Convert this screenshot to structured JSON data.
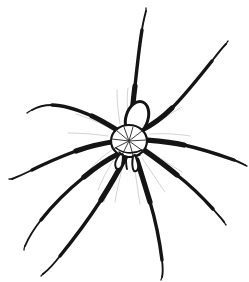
{
  "canvas": {
    "width": 249,
    "height": 282,
    "background_color": "#ffffff",
    "ink_color": "#141414",
    "shading_color": "#9b9b9b",
    "medium": "black-ink-line-drawing",
    "subject": "spider"
  },
  "subject": {
    "name": "spider",
    "common_description": "long-legged spider line drawing",
    "orientation": "dorsal view, head toward lower-left",
    "leg_count": 8,
    "body_parts": [
      "abdomen",
      "cephalothorax",
      "pedipalps",
      "legs"
    ]
  },
  "body": {
    "cephalothorax": {
      "name": "cephalothorax",
      "center_x": 129,
      "center_y": 141,
      "radius_x": 18,
      "radius_y": 16,
      "fill": "#ffffff",
      "stroke": "#141414",
      "has_radial_striations": true,
      "striation_count": 9
    },
    "abdomen": {
      "name": "abdomen",
      "center_x": 137,
      "center_y": 118,
      "radius_x": 11,
      "radius_y": 17,
      "rotation_deg": 18,
      "fill": "#ffffff",
      "stroke": "#141414"
    },
    "pedipalps": {
      "name": "pedipalps",
      "count": 2,
      "left_tip_x": 118,
      "left_tip_y": 166,
      "right_tip_x": 134,
      "right_tip_y": 170
    }
  },
  "legs": [
    {
      "id": "leg-left-1",
      "side": "left",
      "index": 1,
      "description": "front left leg reaching up and left",
      "path": "M 122,133 C 110,126 100,120 86,114 C 70,107 52,104 40,107 C 34,108 30,110 27,112",
      "segments": [
        "femur",
        "tibia",
        "tarsus"
      ],
      "tip_x": 27,
      "tip_y": 112
    },
    {
      "id": "leg-left-2",
      "side": "left",
      "index": 2,
      "description": "second left leg sweeping left and slightly down",
      "path": "M 118,141 C 102,143 86,147 70,153 C 52,160 32,169 18,176 C 14,178 11,179 9,179",
      "segments": [
        "femur",
        "tibia",
        "tarsus"
      ],
      "tip_x": 9,
      "tip_y": 179
    },
    {
      "id": "leg-left-3",
      "side": "left",
      "index": 3,
      "description": "third left leg angling down-left",
      "path": "M 120,153 C 106,160 92,169 78,181 C 62,195 46,212 36,226 C 30,235 26,243 24,249",
      "segments": [
        "femur",
        "tibia",
        "tarsus"
      ],
      "tip_x": 24,
      "tip_y": 249
    },
    {
      "id": "leg-left-4",
      "side": "left",
      "index": 4,
      "description": "rear left leg angling steeply down",
      "path": "M 125,158 C 118,172 108,190 96,210 C 84,230 70,248 56,262 C 50,268 45,272 42,274",
      "segments": [
        "femur",
        "tibia",
        "tarsus"
      ],
      "tip_x": 42,
      "tip_y": 274
    },
    {
      "id": "leg-right-1",
      "side": "right",
      "index": 1,
      "description": "front right leg reaching far up and slightly right",
      "path": "M 131,126 C 132,112 134,96 136,78 C 138,58 140,40 143,26 C 144,18 145,13 146,9",
      "segments": [
        "femur",
        "tibia",
        "tarsus"
      ],
      "tip_x": 146,
      "tip_y": 9
    },
    {
      "id": "leg-right-2",
      "side": "right",
      "index": 2,
      "description": "second right leg reaching up and right",
      "path": "M 142,130 C 152,124 163,116 174,104 C 188,90 202,72 214,58 C 220,51 224,46 227,43",
      "segments": [
        "femur",
        "tibia",
        "tarsus"
      ],
      "tip_x": 227,
      "tip_y": 43
    },
    {
      "id": "leg-right-3",
      "side": "right",
      "index": 3,
      "description": "third right leg sweeping right and slightly down",
      "path": "M 146,140 C 160,141 176,143 192,147 C 210,152 228,158 238,162 C 242,164 244,165 246,166",
      "segments": [
        "femur",
        "tibia",
        "tarsus"
      ],
      "tip_x": 246,
      "tip_y": 166
    },
    {
      "id": "leg-right-4",
      "side": "right",
      "index": 4,
      "description": "fourth right leg angling down-right",
      "path": "M 144,150 C 156,158 170,168 184,180 C 198,192 210,204 218,214 C 221,218 223,221 224,223",
      "segments": [
        "femur",
        "tibia",
        "tarsus"
      ],
      "tip_x": 224,
      "tip_y": 223
    },
    {
      "id": "leg-right-5",
      "side": "right",
      "index": 5,
      "description": "rear right leg angling down",
      "path": "M 137,160 C 142,176 148,194 154,214 C 159,232 162,250 163,264 C 163,270 163,274 162,277",
      "segments": [
        "femur",
        "tibia",
        "tarsus"
      ],
      "tip_x": 162,
      "tip_y": 277
    }
  ],
  "labels": {
    "alt_text": "Black ink line drawing of a long-legged spider with eight slender legs radiating from a small round body"
  }
}
